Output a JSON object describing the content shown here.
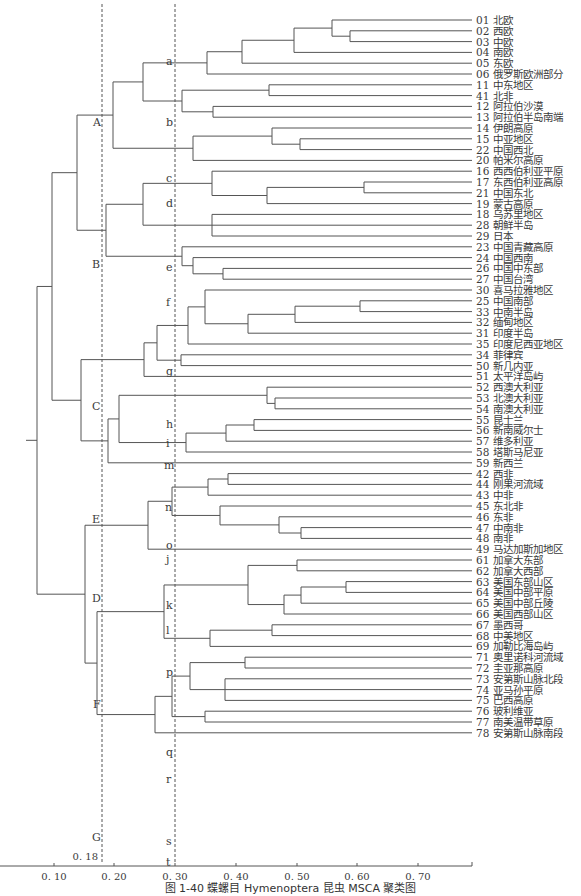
{
  "caption": "图 1-40  蝶螺目 Hymenoptera 昆虫 MSCA 聚类图",
  "axis": {
    "ticks": [
      {
        "value": 0.1,
        "label": "0. 10",
        "x": 54
      },
      {
        "value": 0.2,
        "label": "0. 20",
        "x": 114
      },
      {
        "value": 0.3,
        "label": "0. 30",
        "x": 175
      },
      {
        "value": 0.4,
        "label": "0. 40",
        "x": 236
      },
      {
        "value": 0.5,
        "label": "0. 50",
        "x": 297
      },
      {
        "value": 0.6,
        "label": "0. 60",
        "x": 357
      },
      {
        "value": 0.7,
        "label": "0. 70",
        "x": 418
      }
    ],
    "cutoffs": [
      {
        "value": 0.18,
        "label": "0. 18",
        "x": 102
      },
      {
        "value": 0.3,
        "label": "",
        "x": 175
      }
    ]
  },
  "leaves": [
    {
      "id": "01",
      "name": "北欧"
    },
    {
      "id": "02",
      "name": "西欧"
    },
    {
      "id": "03",
      "name": "中欧"
    },
    {
      "id": "04",
      "name": "南欧"
    },
    {
      "id": "05",
      "name": "东欧"
    },
    {
      "id": "06",
      "name": "俄罗斯欧洲部分"
    },
    {
      "id": "11",
      "name": "中东地区"
    },
    {
      "id": "41",
      "name": "北非"
    },
    {
      "id": "12",
      "name": "阿拉伯沙漠"
    },
    {
      "id": "13",
      "name": "阿拉伯半岛南端"
    },
    {
      "id": "14",
      "name": "伊朗高原"
    },
    {
      "id": "15",
      "name": "中亚地区"
    },
    {
      "id": "22",
      "name": "中国西北"
    },
    {
      "id": "20",
      "name": "帕米尔高原"
    },
    {
      "id": "16",
      "name": "西西伯利亚平原"
    },
    {
      "id": "17",
      "name": "东西伯利亚高原"
    },
    {
      "id": "21",
      "name": "中国东北"
    },
    {
      "id": "19",
      "name": "蒙古高原"
    },
    {
      "id": "18",
      "name": "乌苏里地区"
    },
    {
      "id": "28",
      "name": "朝鲜半岛"
    },
    {
      "id": "29",
      "name": "日本"
    },
    {
      "id": "23",
      "name": "中国青藏高原"
    },
    {
      "id": "24",
      "name": "中国西南"
    },
    {
      "id": "26",
      "name": "中国中东部"
    },
    {
      "id": "27",
      "name": "中国台湾"
    },
    {
      "id": "30",
      "name": "喜马拉雅地区"
    },
    {
      "id": "25",
      "name": "中国南部"
    },
    {
      "id": "33",
      "name": "中南半岛"
    },
    {
      "id": "32",
      "name": "缅甸地区"
    },
    {
      "id": "31",
      "name": "印度半岛"
    },
    {
      "id": "35",
      "name": "印度尼西亚地区"
    },
    {
      "id": "34",
      "name": "菲律宾"
    },
    {
      "id": "50",
      "name": "新几内亚"
    },
    {
      "id": "51",
      "name": "太平洋岛屿"
    },
    {
      "id": "52",
      "name": "西澳大利亚"
    },
    {
      "id": "53",
      "name": "北澳大利亚"
    },
    {
      "id": "54",
      "name": "南澳大利亚"
    },
    {
      "id": "55",
      "name": "昆士兰"
    },
    {
      "id": "56",
      "name": "新南威尔士"
    },
    {
      "id": "57",
      "name": "维多利亚"
    },
    {
      "id": "58",
      "name": "塔斯马尼亚"
    },
    {
      "id": "59",
      "name": "新西兰"
    },
    {
      "id": "42",
      "name": "西非"
    },
    {
      "id": "44",
      "name": "刚果河流域"
    },
    {
      "id": "43",
      "name": "中非"
    },
    {
      "id": "45",
      "name": "东北非"
    },
    {
      "id": "46",
      "name": "东非"
    },
    {
      "id": "47",
      "name": "中南非"
    },
    {
      "id": "48",
      "name": "南非"
    },
    {
      "id": "49",
      "name": "马达加斯加地区"
    },
    {
      "id": "61",
      "name": "加拿大东部"
    },
    {
      "id": "62",
      "name": "加拿大西部"
    },
    {
      "id": "63",
      "name": "美国东部山区"
    },
    {
      "id": "64",
      "name": "美国中部平原"
    },
    {
      "id": "65",
      "name": "美国中部丘陵"
    },
    {
      "id": "66",
      "name": "美国西部山区"
    },
    {
      "id": "67",
      "name": "墨西哥"
    },
    {
      "id": "68",
      "name": "中美地区"
    },
    {
      "id": "69",
      "name": "加勒比海岛屿"
    },
    {
      "id": "71",
      "name": "奥里诺科河流域"
    },
    {
      "id": "72",
      "name": "圭亚那高原"
    },
    {
      "id": "73",
      "name": "安第斯山脉北段"
    },
    {
      "id": "74",
      "name": "亚马孙平原"
    },
    {
      "id": "75",
      "name": "巴西高原"
    },
    {
      "id": "76",
      "name": "玻利维亚"
    },
    {
      "id": "77",
      "name": "南美温带草原"
    },
    {
      "id": "78",
      "name": "安第斯山脉南段"
    }
  ],
  "layout": {
    "first_leaf_y": 20,
    "leaf_spacing": 10.8,
    "leaf_end_x": 472,
    "label_x": 476,
    "root_stub_x": 26
  },
  "tree": {
    "x": 37,
    "c": [
      {
        "x": 52,
        "c": [
          {
            "x": 77,
            "c": [
              {
                "x": 113,
                "label": "A",
                "c": [
                  {
                    "x": 143,
                    "c": [
                      {
                        "x": 207,
                        "label": "a",
                        "c": [
                          {
                            "x": 242,
                            "c": [
                              {
                                "x": 294,
                                "c": [
                                  {
                                    "x": 332,
                                    "c": [
                                      "01",
                                      {
                                        "x": 350,
                                        "c": [
                                          "02",
                                          "03"
                                        ]
                                      }
                                    ]
                                  },
                                  "04"
                                ]
                              },
                              "05"
                            ]
                          },
                          "06"
                        ]
                      },
                      {
                        "x": 182,
                        "label": "b",
                        "c": [
                          {
                            "x": 269,
                            "c": [
                              "11",
                              "41"
                            ]
                          },
                          {
                            "x": 213,
                            "c": [
                              "12",
                              "13"
                            ]
                          }
                        ]
                      }
                    ]
                  },
                  {
                    "x": 193,
                    "label": "c",
                    "c": [
                      {
                        "x": 272,
                        "c": [
                          "14",
                          {
                            "x": 300,
                            "c": [
                              "15",
                              "22"
                            ]
                          }
                        ]
                      },
                      "20"
                    ]
                  }
                ]
              },
              {
                "x": 106,
                "label": "B",
                "c": [
                  {
                    "x": 143,
                    "c": [
                      {
                        "x": 212,
                        "label": "d",
                        "c": [
                          "16",
                          {
                            "x": 267,
                            "c": [
                              {
                                "x": 364,
                                "c": [
                                  "17",
                                  "21"
                                ]
                              },
                              "19"
                            ]
                          }
                        ]
                      },
                      {
                        "x": 212,
                        "label": "e",
                        "c": [
                          "18",
                          "28",
                          "29"
                        ]
                      }
                    ]
                  },
                  {
                    "x": 182,
                    "label": "f",
                    "c": [
                      "23",
                      {
                        "x": 193,
                        "c": [
                          "24",
                          {
                            "x": 223,
                            "c": [
                              "26",
                              "27"
                            ]
                          }
                        ]
                      }
                    ]
                  }
                ]
              }
            ]
          },
          {
            "x": 81,
            "c": [
              {
                "x": 144,
                "label": "C",
                "c": [
                  {
                    "x": 157,
                    "c": [
                      {
                        "x": 188,
                        "label": "g",
                        "c": [
                          {
                            "x": 205,
                            "c": [
                              "30",
                              {
                                "x": 248,
                                "c": [
                                  {
                                    "x": 295,
                                    "c": [
                                      {
                                        "x": 360,
                                        "c": [
                                          "25",
                                          "33"
                                        ]
                                      },
                                      "32"
                                    ]
                                  },
                                  "31"
                                ]
                              }
                            ]
                          },
                          "35"
                        ]
                      },
                      {
                        "x": 181,
                        "label": "h",
                        "c": [
                          "34",
                          "50"
                        ]
                      }
                    ]
                  },
                  {
                    "leaf": "51",
                    "label": "i"
                  }
                ]
              },
              {
                "x": 108,
                "label": "E",
                "c": [
                  {
                    "x": 119,
                    "c": [
                      {
                        "x": 267,
                        "label": "m",
                        "c": [
                          "52",
                          {
                            "x": 275,
                            "c": [
                              "53",
                              "54"
                            ]
                          }
                        ]
                      },
                      {
                        "x": 186,
                        "label": "n",
                        "c": [
                          {
                            "x": 226,
                            "c": [
                              {
                                "x": 254,
                                "c": [
                                  "55",
                                  "56"
                                ]
                              },
                              "57"
                            ]
                          },
                          "58"
                        ]
                      }
                    ]
                  },
                  {
                    "leaf": "59",
                    "label": "o"
                  }
                ]
              }
            ]
          }
        ]
      },
      {
        "x": 85,
        "c": [
          {
            "x": 148,
            "label": "D",
            "c": [
              {
                "x": 172,
                "c": [
                  {
                    "x": 208,
                    "label": "j",
                    "c": [
                      {
                        "x": 228,
                        "c": [
                          "42",
                          "44"
                        ]
                      },
                      "43"
                    ]
                  },
                  {
                    "x": 220,
                    "label": "k",
                    "c": [
                      "45",
                      {
                        "x": 279,
                        "c": [
                          "46",
                          {
                            "x": 301,
                            "c": [
                              "47",
                              "48"
                            ]
                          }
                        ]
                      }
                    ]
                  }
                ]
              },
              {
                "leaf": "49",
                "label": "l"
              }
            ]
          },
          {
            "x": 97,
            "c": [
              {
                "x": 164,
                "label": "F",
                "c": [
                  {
                    "x": 248,
                    "label": "p",
                    "c": [
                      {
                        "x": 297,
                        "c": [
                          "61",
                          "62"
                        ]
                      },
                      {
                        "x": 284,
                        "c": [
                          {
                            "x": 301,
                            "c": [
                              {
                                "x": 346,
                                "c": [
                                  "63",
                                  "64"
                                ]
                              },
                              "65"
                            ]
                          },
                          "66"
                        ]
                      }
                    ]
                  },
                  {
                    "x": 210,
                    "label": "q",
                    "c": [
                      {
                        "x": 272,
                        "c": [
                          "67",
                          "68"
                        ]
                      },
                      "69"
                    ]
                  }
                ]
              },
              {
                "x": 155,
                "label": "G",
                "c": [
                  {
                    "x": 172,
                    "c": [
                      {
                        "x": 190,
                        "label": "r",
                        "c": [
                          {
                            "x": 245,
                            "c": [
                              "71",
                              "72"
                            ]
                          },
                          {
                            "x": 225,
                            "c": [
                              "73",
                              "74",
                              "75"
                            ]
                          }
                        ]
                      },
                      {
                        "x": 205,
                        "label": "s",
                        "c": [
                          "76",
                          "77"
                        ]
                      }
                    ]
                  },
                  {
                    "leaf": "78",
                    "label": "t"
                  }
                ]
              }
            ]
          }
        ]
      }
    ]
  },
  "group_labels": [
    {
      "text": "A",
      "x": 93,
      "y": 126
    },
    {
      "text": "B",
      "x": 92,
      "y": 268
    },
    {
      "text": "C",
      "x": 92,
      "y": 410
    },
    {
      "text": "E",
      "x": 92,
      "y": 523
    },
    {
      "text": "D",
      "x": 92,
      "y": 602
    },
    {
      "text": "F",
      "x": 93,
      "y": 708
    },
    {
      "text": "G",
      "x": 92,
      "y": 841
    },
    {
      "text": "a",
      "x": 166,
      "y": 65
    },
    {
      "text": "b",
      "x": 166,
      "y": 126
    },
    {
      "text": "c",
      "x": 166,
      "y": 182
    },
    {
      "text": "d",
      "x": 166,
      "y": 207
    },
    {
      "text": "e",
      "x": 166,
      "y": 271
    },
    {
      "text": "f",
      "x": 166,
      "y": 306
    },
    {
      "text": "g",
      "x": 166,
      "y": 375
    },
    {
      "text": "h",
      "x": 166,
      "y": 428
    },
    {
      "text": "i",
      "x": 166,
      "y": 447
    },
    {
      "text": "m",
      "x": 164,
      "y": 469
    },
    {
      "text": "n",
      "x": 165,
      "y": 511
    },
    {
      "text": "o",
      "x": 166,
      "y": 549
    },
    {
      "text": "j",
      "x": 166,
      "y": 563
    },
    {
      "text": "k",
      "x": 166,
      "y": 609
    },
    {
      "text": "l",
      "x": 166,
      "y": 634
    },
    {
      "text": "p",
      "x": 166,
      "y": 676
    },
    {
      "text": "q",
      "x": 166,
      "y": 756
    },
    {
      "text": "r",
      "x": 166,
      "y": 783
    },
    {
      "text": "s",
      "x": 166,
      "y": 845
    },
    {
      "text": "t",
      "x": 166,
      "y": 866
    }
  ],
  "colors": {
    "line": "#555555",
    "dash": "#555555",
    "text": "#3a3a3a"
  }
}
